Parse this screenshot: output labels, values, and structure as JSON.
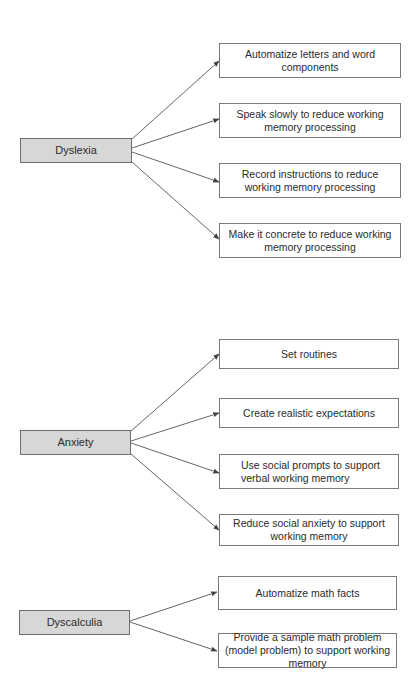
{
  "diagram": {
    "type": "concept-map",
    "colors": {
      "category_fill": "#d7d7d7",
      "category_border": "#6e6e6e",
      "strategy_fill": "#ffffff",
      "strategy_border": "#7a7a7a",
      "arrow": "#555555",
      "text": "#2b2b2b"
    },
    "groups": [
      {
        "category": "Dyslexia",
        "strategies": [
          "Automatize letters and word components",
          "Speak slowly to reduce working memory processing",
          "Record instructions to reduce working memory processing",
          "Make it concrete to reduce working memory processing"
        ]
      },
      {
        "category": "Anxiety",
        "strategies": [
          "Set routines",
          "Create realistic expectations",
          "Use social prompts to support verbal working memory",
          "Reduce social anxiety to support working memory"
        ]
      },
      {
        "category": "Dyscalculia",
        "strategies": [
          "Automatize math facts",
          "Provide a sample math problem (model problem) to support working memory"
        ]
      }
    ]
  }
}
